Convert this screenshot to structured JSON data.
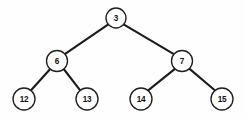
{
  "diagram": {
    "type": "binary-tree",
    "canvas": {
      "width": 245,
      "height": 119
    },
    "style": {
      "background_color": "#fefefe",
      "node_fill": "#ffffff",
      "node_stroke": "#1f1f1f",
      "edge_color": "#1c1c1c",
      "label_color": "#111111"
    },
    "nodes": [
      {
        "id": "n3",
        "label": "3",
        "cx": 116,
        "cy": 18,
        "r": 10.0,
        "level": 0,
        "role": "root"
      },
      {
        "id": "n6",
        "label": "6",
        "cx": 57,
        "cy": 61,
        "r": 10.5,
        "level": 1,
        "role": "internal"
      },
      {
        "id": "n7",
        "label": "7",
        "cx": 182,
        "cy": 61,
        "r": 10.5,
        "level": 1,
        "role": "internal"
      },
      {
        "id": "n12",
        "label": "12",
        "cx": 24,
        "cy": 99,
        "r": 11.0,
        "level": 2,
        "role": "leaf"
      },
      {
        "id": "n13",
        "label": "13",
        "cx": 87,
        "cy": 99,
        "r": 11.0,
        "level": 2,
        "role": "leaf"
      },
      {
        "id": "n14",
        "label": "14",
        "cx": 141,
        "cy": 99,
        "r": 11.0,
        "level": 2,
        "role": "leaf"
      },
      {
        "id": "n15",
        "label": "15",
        "cx": 222,
        "cy": 99,
        "r": 11.0,
        "level": 2,
        "role": "leaf"
      }
    ],
    "edges": [
      {
        "id": "e3-6",
        "from": "n3",
        "from_label": "3",
        "to": "n6",
        "to_label": "6",
        "side": "left",
        "x1": 108.3,
        "y1": 24.3,
        "x2": 64.4,
        "y2": 54.4
      },
      {
        "id": "e3-7",
        "from": "n3",
        "from_label": "3",
        "to": "n7",
        "to_label": "7",
        "side": "right",
        "x1": 123.6,
        "y1": 24.4,
        "x2": 174.7,
        "y2": 54.6
      },
      {
        "id": "e6-12",
        "from": "n6",
        "from_label": "6",
        "to": "n12",
        "to_label": "12",
        "side": "left",
        "x1": 50.2,
        "y1": 69.0,
        "x2": 30.6,
        "y2": 90.8
      },
      {
        "id": "e6-13",
        "from": "n6",
        "from_label": "6",
        "to": "n13",
        "to_label": "13",
        "side": "right",
        "x1": 63.7,
        "y1": 69.0,
        "x2": 80.4,
        "y2": 90.6
      },
      {
        "id": "e7-14",
        "from": "n7",
        "from_label": "7",
        "to": "n14",
        "to_label": "14",
        "side": "left",
        "x1": 175.2,
        "y1": 68.6,
        "x2": 147.9,
        "y2": 90.6
      },
      {
        "id": "e7-15",
        "from": "n7",
        "from_label": "7",
        "to": "n15",
        "to_label": "15",
        "side": "right",
        "x1": 189.0,
        "y1": 68.4,
        "x2": 215.4,
        "y2": 90.7
      }
    ]
  }
}
